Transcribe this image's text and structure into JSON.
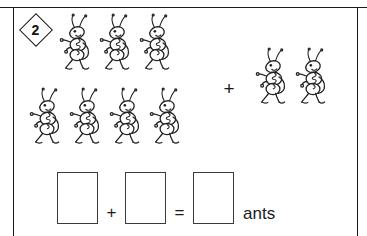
{
  "page": {
    "problem_number": "2",
    "background_color": "#ffffff",
    "ink_color": "#1a1a1a"
  },
  "problem": {
    "type": "addition-word-problem",
    "unit_label": "ants",
    "group_operator": "+",
    "left_group": {
      "name": "left-ant-group",
      "count": 7,
      "rows": [
        {
          "count": 3
        },
        {
          "count": 4
        }
      ]
    },
    "right_group": {
      "name": "right-ant-group",
      "count": 2,
      "rows": [
        {
          "count": 2
        }
      ]
    }
  },
  "equation": {
    "first_addend_value": "",
    "plus_operator": "+",
    "second_addend_value": "",
    "equals_operator": "=",
    "sum_value": "",
    "unit_label": "ants"
  },
  "icons": {
    "ant": "ant-icon",
    "diamond_badge": "diamond-badge-icon"
  }
}
